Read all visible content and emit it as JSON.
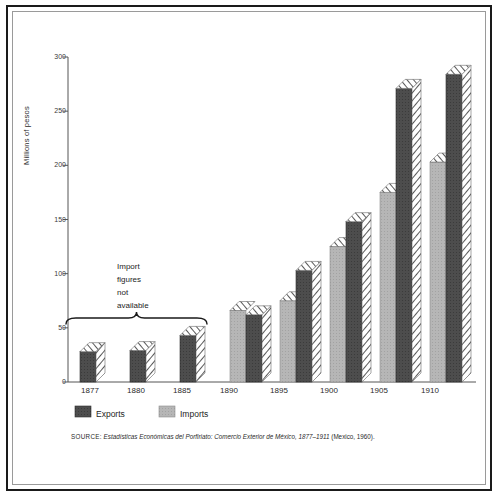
{
  "figure": {
    "ylabel": "Millions of pesos",
    "annotation": [
      "Import",
      "figures",
      "not",
      "available"
    ],
    "source_prefix": "SOURCE:",
    "source_title": "Estadísticas Económicas del Porfiriato: Comercio Exterior de México, 1877–1911",
    "source_suffix": "(Mexico, 1960)."
  },
  "legend": {
    "exports_label": "Exports",
    "imports_label": "Imports",
    "exports_color": "#4d4d4d",
    "imports_color": "#b3b3b3"
  },
  "chart_data": {
    "type": "bar",
    "title": "",
    "xlabel": "",
    "ylabel": "Millions of pesos",
    "ylim": [
      0,
      300
    ],
    "yticks": [
      0,
      50,
      100,
      150,
      200,
      250,
      300
    ],
    "ytick_labels": [
      "0",
      "50",
      "100",
      "150",
      "200",
      "250",
      "300"
    ],
    "grid": false,
    "legend_position": "below-axes-left",
    "categories": [
      "1877",
      "1880",
      "1885",
      "1890",
      "1895",
      "1900",
      "1905",
      "1910"
    ],
    "series": [
      {
        "name": "Imports",
        "color": "#b3b3b3",
        "values": [
          null,
          null,
          null,
          66,
          75,
          125,
          175,
          203
        ]
      },
      {
        "name": "Exports",
        "color": "#4d4d4d",
        "values": [
          28,
          29,
          43,
          62,
          103,
          148,
          271,
          284
        ]
      }
    ],
    "annotations": [
      {
        "text": "Import figures not available",
        "covers": [
          "1877",
          "1880",
          "1885"
        ],
        "marker": "brace"
      }
    ]
  }
}
